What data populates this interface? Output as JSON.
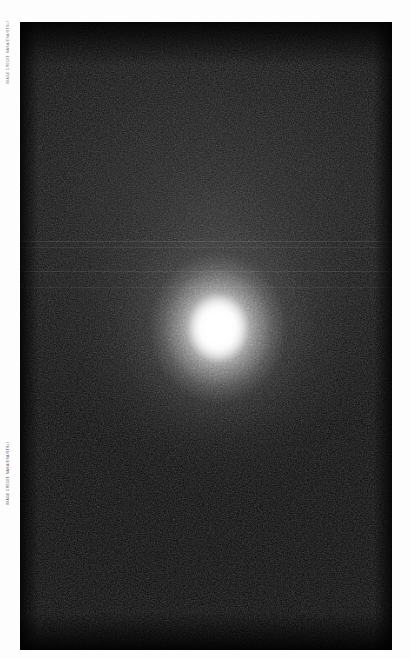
{
  "page": {
    "background_color": "#fdfdfd",
    "width": 410,
    "height": 659
  },
  "plate": {
    "name": "astronomical-image-plate",
    "background_color": "#000000",
    "left": 20,
    "top": 22,
    "width": 372,
    "height": 628,
    "description": "Dark monochrome astronomical exposure showing a single bright unresolved source with an extended diffuse halo on a grainy black sky background."
  },
  "object": {
    "name": "bright-central-source",
    "center_x": 218,
    "center_y": 328,
    "core_color": "#ffffff",
    "halo_color": "#c8c8c8",
    "core_radius_px": 16,
    "halo_radius_px": 130,
    "saturated": true
  },
  "artifacts": {
    "scanlines": [
      {
        "y": 241,
        "height": 1,
        "opacity": 0.16,
        "color": "#9a9a9a"
      },
      {
        "y": 247,
        "height": 1,
        "opacity": 0.12,
        "color": "#888888"
      },
      {
        "y": 271,
        "height": 1,
        "opacity": 0.14,
        "color": "#909090"
      },
      {
        "y": 287,
        "height": 1,
        "opacity": 0.11,
        "color": "#808080"
      }
    ],
    "noise_label": "sensor-grain"
  },
  "credits": {
    "top_text": "IMAGE CREDIT: NASA/ESA/STScI",
    "bottom_text": "IMAGE CREDIT: NASA/ESA/STScI"
  }
}
